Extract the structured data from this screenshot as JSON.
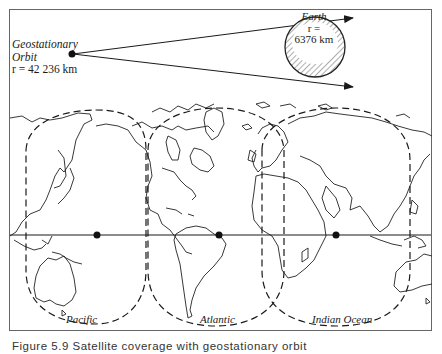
{
  "figure": {
    "caption": "Figure 5.9   Satellite coverage with geostationary orbit",
    "geostationary": {
      "title_line1": "Geostationary",
      "title_line2": "Orbit",
      "radius": "r = 42 236 km"
    },
    "earth": {
      "title": "Earth",
      "radius_label": "r =",
      "radius_value": "6376 km"
    },
    "regions": [
      {
        "name": "Pacific"
      },
      {
        "name": "Atlantic"
      },
      {
        "name": "Indian Ocean"
      }
    ],
    "colors": {
      "line": "#1a1a1a",
      "frame": "#555555",
      "background": "#ffffff"
    }
  }
}
